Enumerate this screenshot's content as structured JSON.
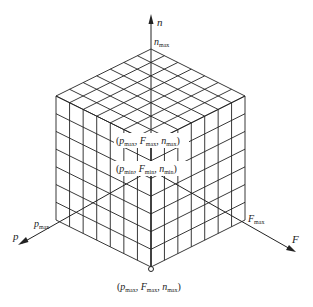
{
  "figure": {
    "axes": {
      "n": {
        "label": "n",
        "max_label_base": "n",
        "max_label_sub": "max"
      },
      "p": {
        "label": "p",
        "max_label_base": "p",
        "max_label_sub": "max"
      },
      "F": {
        "label": "F",
        "max_label_base": "F",
        "max_label_sub": "max"
      }
    },
    "grid_divisions": 7,
    "points": {
      "upper": {
        "p": "p",
        "p_sub": "max",
        "F": "F",
        "F_sub": "max",
        "n": "n",
        "n_sub": "max"
      },
      "lower": {
        "p": "p",
        "p_sub": "min",
        "F": "F",
        "F_sub": "min",
        "n": "n",
        "n_sub": "min"
      },
      "bottom": {
        "p": "p",
        "p_sub": "max",
        "F": "F",
        "F_sub": "max",
        "n": "n",
        "n_sub": "max"
      }
    },
    "colors": {
      "line": "#222222",
      "background": "#ffffff"
    }
  }
}
